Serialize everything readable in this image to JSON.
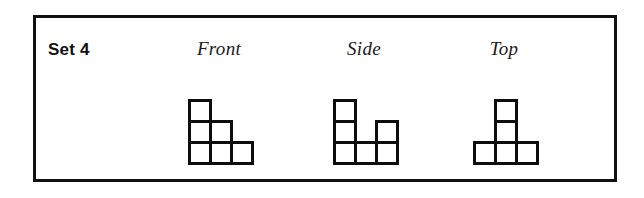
{
  "panel": {
    "set_label": "Set 4",
    "border_color": "#111111",
    "background_color": "#ffffff"
  },
  "views": [
    {
      "id": "front",
      "label": "Front",
      "shape_name": "staircase",
      "grid": [
        [
          1,
          0,
          0
        ],
        [
          1,
          1,
          0
        ],
        [
          1,
          1,
          1
        ]
      ],
      "cube_count": 6
    },
    {
      "id": "side",
      "label": "Side",
      "shape_name": "notched-staircase",
      "grid": [
        [
          1,
          0,
          0
        ],
        [
          1,
          0,
          1
        ],
        [
          1,
          1,
          1
        ]
      ],
      "cube_count": 6
    },
    {
      "id": "top",
      "label": "Top",
      "shape_name": "t-shape",
      "grid": [
        [
          0,
          1,
          0
        ],
        [
          0,
          1,
          0
        ],
        [
          1,
          1,
          1
        ]
      ],
      "cube_count": 5
    }
  ],
  "style": {
    "cell_stroke_color": "#0d0d0d",
    "cell_fill_color": "#ffffff",
    "cell_size_px": 24
  }
}
